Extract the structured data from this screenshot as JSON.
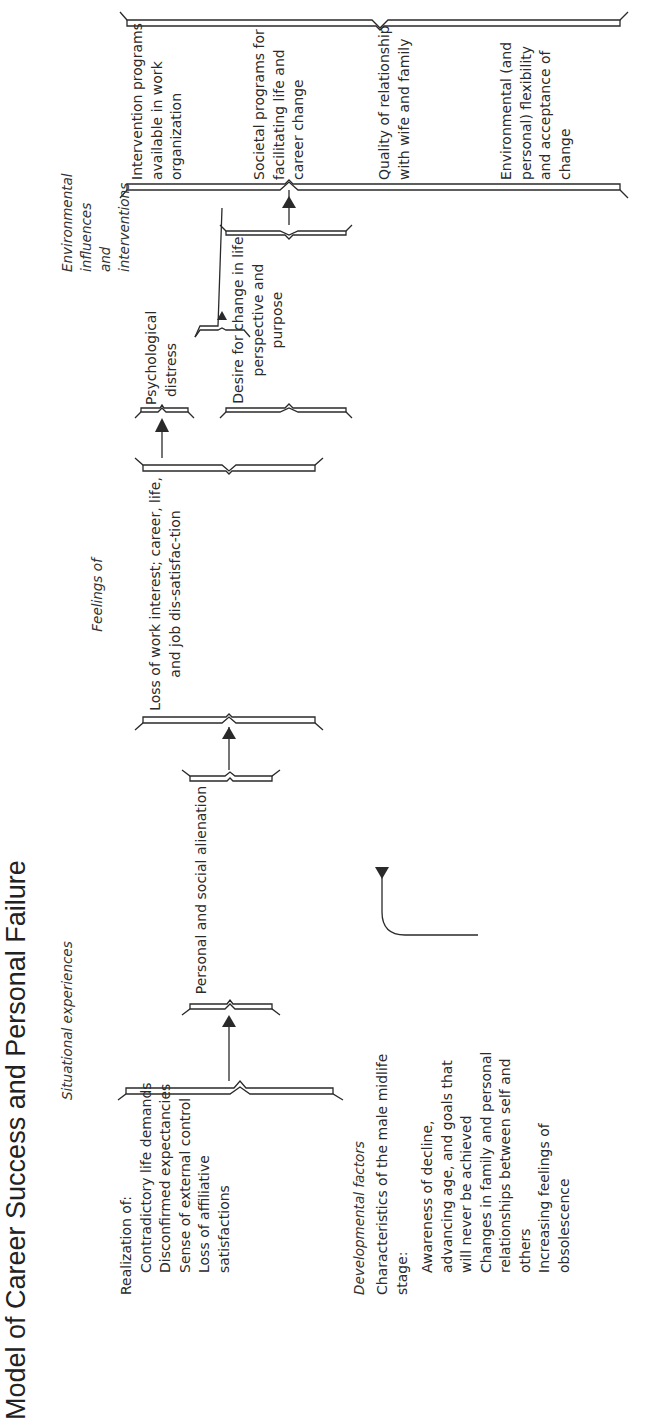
{
  "title": "Model of Career Success and Personal Failure",
  "columns": {
    "situational": {
      "header": "Situational experiences",
      "intro": "Realization of:",
      "items": [
        "Contradictory life demands",
        "Disconfirmed expectancies",
        "Sense of external control",
        "Loss of affiliative satisfactions"
      ]
    },
    "developmental": {
      "header": "Developmental factors",
      "intro": "Characteristics of the male midlife stage:",
      "items": [
        "Awareness of decline, advancing age, and goals that will never be achieved",
        "Changes in family and personal relationships between self and others",
        "Increasing feelings of obsolescence"
      ]
    },
    "alienation": {
      "text": "Personal and social alienation"
    },
    "feelings": {
      "header": "Feelings of",
      "text": "Loss of work interest; career, life, and job dis-satisfac-tion"
    },
    "distress": {
      "text": "Psychological distress"
    },
    "desire": {
      "text": "Desire for change in life perspective and purpose"
    },
    "environmental": {
      "header": "Environmental influences and interventions",
      "items": [
        "Intervention programs available in work organization",
        "Societal programs for facilitating life and career change",
        "Quality of relationship with wife and family",
        "Environmental (and personal) flexibility and acceptance of change"
      ]
    },
    "resolutions": {
      "header": "Possible resolutions",
      "items": [
        "Decision for new career and/or new family life",
        "Rededication to old career with new perspectives and acceptance of inevitable imper-fections of life",
        "Acceptance of old career with little interest or enthusiasm; dedication to avocational goals",
        "Continuing distress with no resolution"
      ]
    }
  },
  "colors": {
    "ink": "#2a2a2a",
    "background": "#ffffff"
  }
}
